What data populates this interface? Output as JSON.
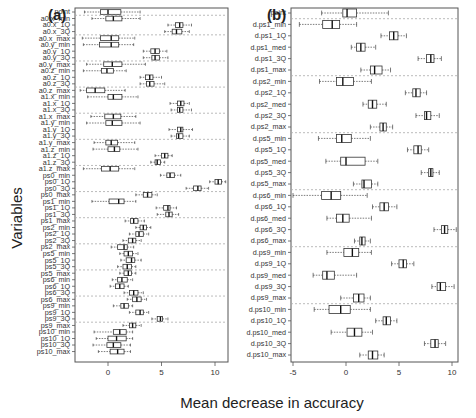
{
  "chart_data": [
    {
      "type": "boxplot",
      "panel": "(a)",
      "title": "(a)",
      "xlabel": "Mean decrease in accuracy",
      "ylabel": "Variables",
      "xlim": [
        -3,
        11.2
      ],
      "xticks": [
        0,
        5,
        10
      ],
      "grid": "dashed separators between variable groups",
      "categories": [
        "point",
        "a0.x_min",
        "a0.x_1Q",
        "a0.x_3Q",
        "a0.x_max",
        "a0.y_min",
        "a0.y_1Q",
        "a0.y_3Q",
        "a0.y_max",
        "a0.z_min",
        "a0.z_1Q",
        "a0.z_3Q",
        "a0.z_max",
        "a1.x_min",
        "a1.x_1Q",
        "a1.x_3Q",
        "a1.x_max",
        "a1.y_min",
        "a1.y_1Q",
        "a1.y_3Q",
        "a1.y_max",
        "a1.z_min",
        "a1.z_1Q",
        "a1.z_3Q",
        "a1.z_max",
        "ps0_min",
        "ps0_1Q",
        "ps0_3Q",
        "ps0_max",
        "ps1_min",
        "ps1_1Q",
        "ps1_3Q",
        "ps1_max",
        "ps2_min",
        "ps2_1Q",
        "ps2_3Q",
        "ps2_max",
        "ps5_min",
        "ps5_1Q",
        "ps5_3Q",
        "ps5_max",
        "ps6_min",
        "ps6_1Q",
        "ps6_3Q",
        "ps6_max",
        "ps9_min",
        "ps9_1Q",
        "ps9_3Q",
        "ps9_max",
        "ps10_min",
        "ps10_1Q",
        "ps10_3Q",
        "ps10_max"
      ],
      "boxes": [
        [
          -2.2,
          -0.7,
          0.0,
          1.2,
          3.0
        ],
        [
          -1.5,
          -0.2,
          0.5,
          1.3,
          3.0
        ],
        [
          5.6,
          6.3,
          6.7,
          7.0,
          7.8
        ],
        [
          5.3,
          6.0,
          6.4,
          6.9,
          7.6
        ],
        [
          -2.4,
          -0.7,
          0.3,
          1.0,
          2.5
        ],
        [
          -2.3,
          -0.8,
          0.3,
          1.0,
          2.4
        ],
        [
          3.3,
          4.0,
          4.4,
          4.8,
          5.5
        ],
        [
          3.3,
          4.1,
          4.4,
          4.8,
          5.6
        ],
        [
          -2.0,
          -0.4,
          0.4,
          1.3,
          3.5
        ],
        [
          -2.3,
          -0.6,
          -0.1,
          0.5,
          1.7
        ],
        [
          3.0,
          3.5,
          3.9,
          4.2,
          5.0
        ],
        [
          3.0,
          3.6,
          3.9,
          4.3,
          5.3
        ],
        [
          -2.6,
          -2.0,
          -1.2,
          -0.3,
          1.6
        ],
        [
          -1.9,
          0.0,
          0.5,
          1.3,
          2.8
        ],
        [
          5.8,
          6.5,
          6.8,
          7.1,
          7.6
        ],
        [
          5.9,
          6.5,
          6.7,
          7.0,
          7.8
        ],
        [
          -1.6,
          -0.3,
          0.5,
          1.2,
          2.6
        ],
        [
          -2.0,
          -0.2,
          0.4,
          1.3,
          3.0
        ],
        [
          5.7,
          6.5,
          6.8,
          7.0,
          7.9
        ],
        [
          5.9,
          6.4,
          6.6,
          7.0,
          7.6
        ],
        [
          -1.3,
          -0.2,
          0.3,
          0.9,
          2.5
        ],
        [
          -1.4,
          0.0,
          0.6,
          1.1,
          2.8
        ],
        [
          4.4,
          5.0,
          5.3,
          5.6,
          6.0
        ],
        [
          4.0,
          4.4,
          4.6,
          4.9,
          5.3
        ],
        [
          -2.3,
          -0.6,
          0.2,
          1.0,
          2.5
        ],
        [
          4.9,
          5.5,
          5.8,
          6.2,
          6.8
        ],
        [
          9.5,
          10.0,
          10.3,
          10.6,
          11.0
        ],
        [
          7.3,
          8.0,
          8.4,
          8.7,
          9.4
        ],
        [
          2.6,
          3.3,
          3.7,
          4.1,
          4.6
        ],
        [
          -1.5,
          0.1,
          1.0,
          1.5,
          2.6
        ],
        [
          4.5,
          5.2,
          5.6,
          5.8,
          6.4
        ],
        [
          4.6,
          5.4,
          5.7,
          6.0,
          6.6
        ],
        [
          1.6,
          2.1,
          2.4,
          2.8,
          3.4
        ],
        [
          2.6,
          3.0,
          3.3,
          3.6,
          4.0
        ],
        [
          2.0,
          2.6,
          2.9,
          3.3,
          3.8
        ],
        [
          1.4,
          1.9,
          2.3,
          2.6,
          3.1
        ],
        [
          0.3,
          0.9,
          1.5,
          1.8,
          2.4
        ],
        [
          1.1,
          1.5,
          1.9,
          2.3,
          2.8
        ],
        [
          1.2,
          1.7,
          2.2,
          2.5,
          3.1
        ],
        [
          0.9,
          1.4,
          1.8,
          2.2,
          2.6
        ],
        [
          1.1,
          1.5,
          1.9,
          2.2,
          2.6
        ],
        [
          0.4,
          0.9,
          1.3,
          1.8,
          2.3
        ],
        [
          0.2,
          0.7,
          1.1,
          1.5,
          1.9
        ],
        [
          1.5,
          2.0,
          2.4,
          2.8,
          3.3
        ],
        [
          1.8,
          2.3,
          2.7,
          3.1,
          3.6
        ],
        [
          0.5,
          1.2,
          1.5,
          1.9,
          2.3
        ],
        [
          2.0,
          2.6,
          3.0,
          3.3,
          3.8
        ],
        [
          4.1,
          4.6,
          4.9,
          5.1,
          5.6
        ],
        [
          1.4,
          2.0,
          2.3,
          2.6,
          3.1
        ],
        [
          -1.3,
          0.5,
          1.1,
          1.7,
          2.3
        ],
        [
          -1.1,
          0.0,
          0.8,
          1.7,
          2.3
        ],
        [
          -1.4,
          -0.1,
          0.5,
          1.2,
          2.1
        ],
        [
          -0.9,
          0.2,
          0.9,
          1.5,
          2.1
        ]
      ],
      "box_format": [
        "whisker_low",
        "q1",
        "median",
        "q3",
        "whisker_high"
      ],
      "group_separators_after": [
        "point",
        "a0.x_3Q",
        "a0.y_3Q",
        "a0.z_3Q",
        "a1.x_3Q",
        "a1.y_3Q",
        "a1.z_3Q",
        "ps0_3Q",
        "ps1_3Q",
        "ps2_3Q",
        "ps5_3Q",
        "ps6_3Q",
        "ps9_3Q"
      ]
    },
    {
      "type": "boxplot",
      "panel": "(b)",
      "title": "(b)",
      "xlabel": "Mean decrease in accuracy",
      "ylabel": "",
      "xlim": [
        -5.2,
        10.6
      ],
      "xticks": [
        -5,
        0,
        5,
        10
      ],
      "grid": "dashed separators between variable groups",
      "categories": [
        "point",
        "d.ps1_min",
        "d.ps1_1Q",
        "d.ps1_med",
        "d.ps1_3Q",
        "d.ps1_max",
        "d.ps2_min",
        "d.ps2_1Q",
        "d.ps2_med",
        "d.ps2_3Q",
        "d.ps2_max",
        "d.ps5_min",
        "d.ps5_1Q",
        "d.ps5_med",
        "d.ps5_3Q",
        "d.ps5_max",
        "d.ps6_min",
        "d.ps6_1Q",
        "d.ps6_med",
        "d.ps6_3Q",
        "d.ps6_max",
        "d.ps9_min",
        "d.ps9_1Q",
        "d.ps9_med",
        "d.ps9_3Q",
        "d.ps9_max",
        "d.ps10_min",
        "d.ps10_1Q",
        "d.ps10_med",
        "d.ps10_3Q",
        "d.ps10_max"
      ],
      "boxes": [
        [
          -2.3,
          -0.3,
          0.1,
          1.0,
          4.0
        ],
        [
          -4.4,
          -2.2,
          -1.3,
          -0.6,
          1.0
        ],
        [
          3.3,
          4.1,
          4.5,
          4.9,
          5.7
        ],
        [
          0.5,
          1.0,
          1.4,
          1.8,
          2.8
        ],
        [
          6.8,
          7.6,
          8.0,
          8.3,
          9.0
        ],
        [
          1.4,
          2.3,
          2.7,
          3.4,
          4.2
        ],
        [
          -2.5,
          -0.9,
          -0.3,
          0.7,
          2.4
        ],
        [
          5.6,
          6.3,
          6.6,
          7.0,
          7.6
        ],
        [
          1.6,
          2.1,
          2.5,
          2.9,
          3.8
        ],
        [
          6.6,
          7.4,
          7.6,
          8.0,
          8.8
        ],
        [
          2.3,
          3.2,
          3.5,
          3.8,
          4.4
        ],
        [
          -2.6,
          -0.9,
          -0.4,
          0.5,
          2.3
        ],
        [
          5.8,
          6.4,
          6.8,
          7.1,
          7.8
        ],
        [
          -1.9,
          -0.5,
          0.0,
          1.8,
          3.0
        ],
        [
          7.1,
          7.8,
          8.0,
          8.2,
          8.8
        ],
        [
          0.7,
          1.5,
          1.7,
          2.4,
          3.0
        ],
        [
          -5.0,
          -2.3,
          -1.4,
          -0.5,
          2.0
        ],
        [
          2.5,
          3.2,
          3.6,
          4.0,
          4.8
        ],
        [
          -1.8,
          -0.9,
          -0.3,
          0.3,
          2.4
        ],
        [
          8.3,
          9.0,
          9.3,
          9.6,
          10.4
        ],
        [
          0.8,
          1.3,
          1.5,
          1.8,
          2.3
        ],
        [
          -1.8,
          -0.2,
          0.6,
          1.2,
          2.4
        ],
        [
          4.3,
          5.0,
          5.4,
          5.7,
          6.4
        ],
        [
          -3.1,
          -2.2,
          -1.8,
          -1.1,
          1.0
        ],
        [
          8.1,
          8.6,
          8.9,
          9.4,
          10.2
        ],
        [
          -0.5,
          0.7,
          1.2,
          1.7,
          2.3
        ],
        [
          -3.0,
          -1.6,
          -0.5,
          0.4,
          2.3
        ],
        [
          2.8,
          3.5,
          3.8,
          4.2,
          4.8
        ],
        [
          -1.4,
          0.1,
          0.8,
          1.5,
          2.5
        ],
        [
          7.4,
          8.0,
          8.4,
          8.7,
          9.4
        ],
        [
          1.3,
          2.1,
          2.5,
          3.0,
          3.6
        ]
      ],
      "box_format": [
        "whisker_low",
        "q1",
        "median",
        "q3",
        "whisker_high"
      ],
      "group_separators_after": [
        "point",
        "d.ps1_max",
        "d.ps2_max",
        "d.ps5_max",
        "d.ps6_max",
        "d.ps9_max"
      ]
    }
  ],
  "labels": {
    "panel_a": "(a)",
    "panel_b": "(b)",
    "y_title": "Variables",
    "x_title": "Mean decrease in accuracy"
  },
  "layout": {
    "a": {
      "x0": 75,
      "x1": 228,
      "y0": 8,
      "y1": 362,
      "row0": 12,
      "row_step": 6.53,
      "zero_px": 108,
      "px_per_unit": 10.7
    },
    "b": {
      "x0": 291,
      "x1": 458,
      "y0": 8,
      "y1": 362,
      "row0": 13,
      "row_step": 11.4,
      "zero_px": 346,
      "px_per_unit": 10.6
    }
  },
  "colors": {
    "axis": "#555555",
    "box": "#333333",
    "whisker": "#444444",
    "separator": "#aaaaaa"
  }
}
